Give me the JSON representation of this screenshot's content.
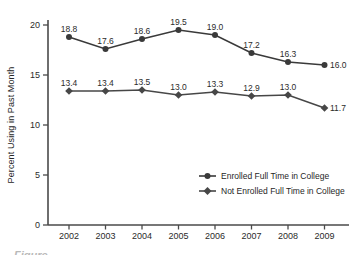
{
  "chart_data": {
    "type": "line",
    "title": "",
    "xlabel": "",
    "ylabel": "Percent Using in Past Month",
    "categories": [
      "2002",
      "2003",
      "2004",
      "2005",
      "2006",
      "2007",
      "2008",
      "2009"
    ],
    "yticks": [
      0,
      5,
      10,
      15,
      20
    ],
    "ylim": [
      0,
      20
    ],
    "grid": false,
    "legend_position": "inside-lower-right",
    "series": [
      {
        "name": "Enrolled Full Time in College",
        "marker": "circle",
        "values": [
          18.8,
          17.6,
          18.6,
          19.5,
          19.0,
          17.2,
          16.3,
          16.0
        ]
      },
      {
        "name": "Not Enrolled Full Time in College",
        "marker": "diamond",
        "values": [
          13.4,
          13.4,
          13.5,
          13.0,
          13.3,
          12.9,
          13.0,
          11.7
        ]
      }
    ]
  },
  "colors": {
    "line_enrolled": "#3a3a3a",
    "line_not_enrolled": "#474747",
    "axis": "#4a4a4a",
    "text": "#262626",
    "label_text": "#2b2b2b"
  },
  "caption_fragment": "Figure"
}
